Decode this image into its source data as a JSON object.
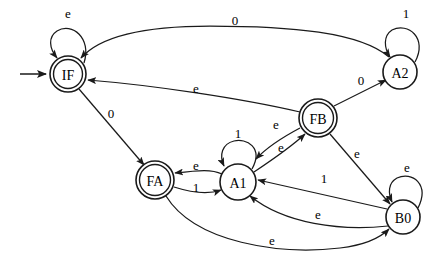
{
  "diagram": {
    "type": "finite-state-automaton",
    "title": "",
    "colors": {
      "stroke": "#1a1a1a",
      "fill": "#ffffff",
      "text": "#000000",
      "background": "#ffffff"
    },
    "start_state": "IF",
    "states": [
      {
        "id": "IF",
        "label": "IF",
        "accepting": true,
        "start": true,
        "cx": 68,
        "cy": 74,
        "r": 18
      },
      {
        "id": "A2",
        "label": "A2",
        "accepting": false,
        "start": false,
        "cx": 400,
        "cy": 72,
        "r": 17
      },
      {
        "id": "FB",
        "label": "FB",
        "accepting": true,
        "start": false,
        "cx": 318,
        "cy": 118,
        "r": 19
      },
      {
        "id": "FA",
        "label": "FA",
        "accepting": true,
        "start": false,
        "cx": 155,
        "cy": 180,
        "r": 19
      },
      {
        "id": "A1",
        "label": "A1",
        "accepting": false,
        "start": false,
        "cx": 238,
        "cy": 182,
        "r": 18
      },
      {
        "id": "B0",
        "label": "B0",
        "accepting": false,
        "start": false,
        "cx": 403,
        "cy": 217,
        "r": 17
      }
    ],
    "transitions": [
      {
        "id": "t-if-if",
        "from": "IF",
        "to": "IF",
        "label": "e",
        "kind": "self",
        "label_x": 68,
        "label_y": 13
      },
      {
        "id": "t-a2-a2",
        "from": "A2",
        "to": "A2",
        "label": "1",
        "kind": "self",
        "label_x": 404,
        "label_y": 13
      },
      {
        "id": "t-a1-a1",
        "from": "A1",
        "to": "A1",
        "label": "1",
        "kind": "self",
        "label_x": 238,
        "label_y": 133
      },
      {
        "id": "t-b0-b0",
        "from": "B0",
        "to": "B0",
        "label": "e",
        "kind": "self",
        "label_x": 406,
        "label_y": 167
      },
      {
        "id": "t-a2-if",
        "from": "A2",
        "to": "IF",
        "label": "0",
        "kind": "curve",
        "label_x": 235,
        "label_y": 20
      },
      {
        "id": "t-fb-if",
        "from": "FB",
        "to": "IF",
        "label": "e",
        "kind": "curve",
        "label_x": 196,
        "label_y": 88
      },
      {
        "id": "t-if-fa",
        "from": "IF",
        "to": "FA",
        "label": "0",
        "kind": "line",
        "label_x": 111,
        "label_y": 113
      },
      {
        "id": "t-fb-a2",
        "from": "FB",
        "to": "A2",
        "label": "0",
        "kind": "line",
        "label_x": 361,
        "label_y": 80
      },
      {
        "id": "t-fb-a1",
        "from": "FB",
        "to": "A1",
        "label": "e",
        "kind": "curve",
        "label_x": 276,
        "label_y": 124
      },
      {
        "id": "t-a1-fb",
        "from": "A1",
        "to": "FB",
        "label": "e",
        "kind": "curve",
        "label_x": 280,
        "label_y": 146
      },
      {
        "id": "t-a1-fa",
        "from": "A1",
        "to": "FA",
        "label": "e",
        "kind": "curve",
        "label_x": 196,
        "label_y": 166
      },
      {
        "id": "t-fa-a1",
        "from": "FA",
        "to": "A1",
        "label": "1",
        "kind": "curve",
        "label_x": 196,
        "label_y": 186
      },
      {
        "id": "t-fb-b0",
        "from": "FB",
        "to": "B0",
        "label": "e",
        "kind": "line",
        "label_x": 357,
        "label_y": 153
      },
      {
        "id": "t-b0-a1-1",
        "from": "B0",
        "to": "A1",
        "label": "1",
        "kind": "line",
        "label_x": 324,
        "label_y": 180
      },
      {
        "id": "t-b0-a1-e",
        "from": "B0",
        "to": "A1",
        "label": "e",
        "kind": "curve",
        "label_x": 318,
        "label_y": 215
      },
      {
        "id": "t-fa-b0",
        "from": "FA",
        "to": "B0",
        "label": "e",
        "kind": "curve",
        "label_x": 272,
        "label_y": 240
      }
    ],
    "start_marker": {
      "id": "start-arrow",
      "x1": 20,
      "y1": 74,
      "x2": 47,
      "y2": 74
    },
    "alphabet": [
      "0",
      "1",
      "e"
    ]
  }
}
